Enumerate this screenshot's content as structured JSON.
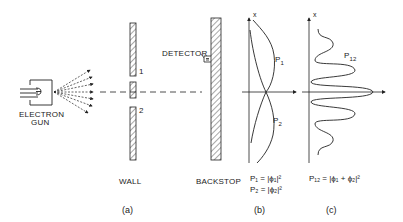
{
  "figure": {
    "panels": [
      {
        "id": "a",
        "caption": "(a)"
      },
      {
        "id": "b",
        "caption": "(b)"
      },
      {
        "id": "c",
        "caption": "(c)"
      }
    ],
    "labels": {
      "electron_gun_line1": "ELECTRON",
      "electron_gun_line2": "GUN",
      "wall": "WALL",
      "backstop": "BACKSTOP",
      "detector": "DETECTOR",
      "slit1": "1",
      "slit2": "2",
      "axis_b": "x",
      "axis_c": "x",
      "curve_p1": "P",
      "curve_p1_sub": "1",
      "curve_p2": "P",
      "curve_p2_sub": "2",
      "curve_p12": "P",
      "curve_p12_sub": "12"
    },
    "equations": {
      "b_line1": "P₁ = |ϕ₁|²",
      "b_line2": "P₂ = |ϕ₂|²",
      "c_line1": "P₁₂ = |ϕ₁ + ϕ₂|²"
    },
    "colors": {
      "ink": "#222222",
      "background": "#ffffff"
    }
  }
}
